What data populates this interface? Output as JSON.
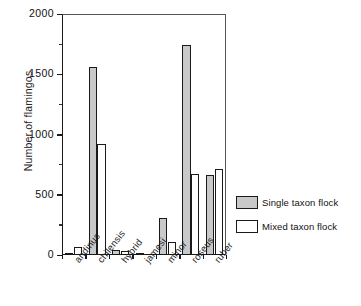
{
  "chart_data": {
    "type": "bar",
    "title": "",
    "xlabel": "",
    "ylabel": "Number of flamingos",
    "ylim": [
      0,
      2000
    ],
    "ytick_values": [
      0,
      500,
      1000,
      1500,
      2000
    ],
    "ytick_labels": [
      "0",
      "500",
      "1000",
      "1500",
      "2000"
    ],
    "yminor_values": [
      250,
      750,
      1250,
      1750
    ],
    "grid": false,
    "legend_position": "right",
    "categories": [
      "andinus",
      "chilensis",
      "hybrid",
      "jamesi",
      "minor",
      "roseus",
      "ruber"
    ],
    "series": [
      {
        "name": "Single taxon flock",
        "color": "#c9c9c9",
        "values": [
          20,
          1560,
          40,
          5,
          310,
          1740,
          660
        ]
      },
      {
        "name": "Mixed taxon flock",
        "color": "#ffffff",
        "values": [
          70,
          920,
          30,
          0,
          105,
          670,
          710
        ]
      }
    ]
  },
  "legend": {
    "items": [
      {
        "label": "Single taxon flock",
        "swatch": "single"
      },
      {
        "label": "Mixed taxon flock",
        "swatch": "mixed"
      }
    ]
  }
}
